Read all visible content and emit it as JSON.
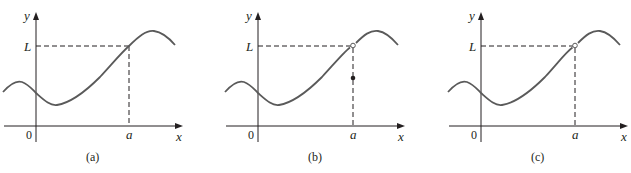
{
  "figure": {
    "colors": {
      "curve": "#5a5a5a",
      "axis": "#231f20",
      "dashed": "#231f20",
      "text": "#231f20",
      "background": "#ffffff"
    },
    "panels": [
      {
        "id": "a",
        "caption": "(a)",
        "y_label": "y",
        "x_label": "x",
        "origin_label": "0",
        "a_label": "a",
        "L_label": "L",
        "point_at_a": "continuous (curve passes through (a, L))",
        "hole_at_a_L": false,
        "dot_below": false
      },
      {
        "id": "b",
        "caption": "(b)",
        "y_label": "y",
        "x_label": "x",
        "origin_label": "0",
        "a_label": "a",
        "L_label": "L",
        "point_at_a": "hole at (a, L); f(a) defined at a different value below L",
        "hole_at_a_L": true,
        "dot_below": true
      },
      {
        "id": "c",
        "caption": "(c)",
        "y_label": "y",
        "x_label": "x",
        "origin_label": "0",
        "a_label": "a",
        "L_label": "L",
        "point_at_a": "hole at (a, L); f(a) undefined",
        "hole_at_a_L": true,
        "dot_below": false
      }
    ]
  }
}
